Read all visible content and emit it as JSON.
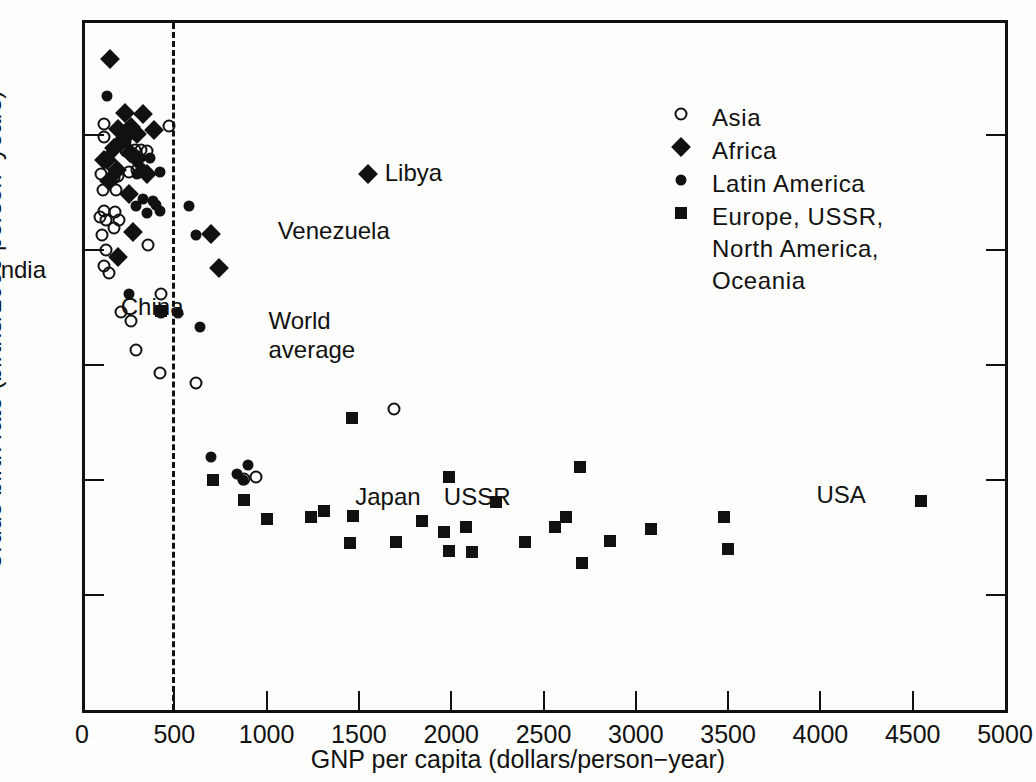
{
  "chart_data": {
    "type": "scatter",
    "title": "",
    "xlabel": "GNP per capita (dollars/person−year)",
    "ylabel": "Crude birth rate (births/1000 person−years)",
    "xlim": [
      0,
      5000
    ],
    "ylim": [
      0,
      60
    ],
    "xticks": [
      0,
      500,
      1000,
      1500,
      2000,
      2500,
      3000,
      3500,
      4000,
      4500,
      5000
    ],
    "yticks": [
      0,
      10,
      20,
      30,
      40,
      50,
      60
    ],
    "grid": false,
    "legend_position": "upper-right-inside",
    "reference_line": {
      "type": "vertical-dashed",
      "x": 490
    },
    "series": [
      {
        "name": "Asia",
        "marker": "open-circle",
        "points": [
          [
            120,
            51.0
          ],
          [
            120,
            49.8
          ],
          [
            105,
            46.6
          ],
          [
            112,
            45.2
          ],
          [
            118,
            43.4
          ],
          [
            100,
            42.9
          ],
          [
            128,
            42.6
          ],
          [
            108,
            41.3
          ],
          [
            132,
            40.0
          ],
          [
            118,
            38.6
          ],
          [
            145,
            38.0
          ],
          [
            160,
            47.4
          ],
          [
            172,
            46.3
          ],
          [
            196,
            46.4
          ],
          [
            186,
            45.2
          ],
          [
            180,
            43.3
          ],
          [
            200,
            42.6
          ],
          [
            176,
            41.9
          ],
          [
            240,
            48.6
          ],
          [
            262,
            48.5
          ],
          [
            252,
            46.8
          ],
          [
            288,
            48.7
          ],
          [
            300,
            47.0
          ],
          [
            320,
            48.7
          ],
          [
            352,
            48.6
          ],
          [
            360,
            40.4
          ],
          [
            470,
            50.8
          ],
          [
            430,
            36.2
          ],
          [
            210,
            34.6
          ],
          [
            268,
            33.8
          ],
          [
            292,
            31.3
          ],
          [
            420,
            29.3
          ],
          [
            620,
            28.4
          ],
          [
            880,
            20.1
          ],
          [
            940,
            20.3
          ],
          [
            1690,
            26.2
          ]
        ]
      },
      {
        "name": "Africa",
        "marker": "filled-diamond",
        "points": [
          [
            150,
            56.6
          ],
          [
            232,
            51.9
          ],
          [
            330,
            51.8
          ],
          [
            196,
            50.5
          ],
          [
            266,
            50.7
          ],
          [
            252,
            50.2
          ],
          [
            300,
            50.1
          ],
          [
            392,
            50.4
          ],
          [
            120,
            47.8
          ],
          [
            138,
            47.8
          ],
          [
            176,
            48.9
          ],
          [
            212,
            49.4
          ],
          [
            188,
            47.0
          ],
          [
            258,
            48.4
          ],
          [
            300,
            47.9
          ],
          [
            148,
            46.0
          ],
          [
            256,
            44.9
          ],
          [
            352,
            46.6
          ],
          [
            276,
            41.6
          ],
          [
            196,
            39.4
          ],
          [
            700,
            41.4
          ],
          [
            740,
            38.4
          ],
          [
            1550,
            46.6
          ]
        ]
      },
      {
        "name": "Latin America",
        "marker": "filled-circle",
        "points": [
          [
            136,
            53.4
          ],
          [
            240,
            49.4
          ],
          [
            270,
            48.2
          ],
          [
            320,
            47.1
          ],
          [
            370,
            48.0
          ],
          [
            300,
            46.6
          ],
          [
            420,
            46.8
          ],
          [
            330,
            44.4
          ],
          [
            386,
            44.3
          ],
          [
            292,
            43.8
          ],
          [
            352,
            43.2
          ],
          [
            422,
            43.4
          ],
          [
            402,
            43.9
          ],
          [
            256,
            36.2
          ],
          [
            430,
            34.5
          ],
          [
            520,
            34.5
          ],
          [
            578,
            43.8
          ],
          [
            620,
            41.3
          ],
          [
            640,
            33.3
          ],
          [
            700,
            22.0
          ],
          [
            900,
            21.3
          ],
          [
            870,
            20.0
          ],
          [
            840,
            20.5
          ]
        ]
      },
      {
        "name": "Europe, USSR, North America, Oceania",
        "marker": "filled-square",
        "points": [
          [
            430,
            34.7
          ],
          [
            710,
            20.0
          ],
          [
            880,
            18.3
          ],
          [
            1000,
            16.6
          ],
          [
            1240,
            16.8
          ],
          [
            1310,
            17.3
          ],
          [
            1470,
            16.9
          ],
          [
            1450,
            14.5
          ],
          [
            1460,
            25.4
          ],
          [
            1700,
            14.6
          ],
          [
            1840,
            16.4
          ],
          [
            1960,
            15.5
          ],
          [
            1990,
            20.3
          ],
          [
            1990,
            13.8
          ],
          [
            2080,
            15.9
          ],
          [
            2110,
            13.7
          ],
          [
            2240,
            18.1
          ],
          [
            2400,
            14.6
          ],
          [
            2560,
            15.9
          ],
          [
            2620,
            16.8
          ],
          [
            2700,
            21.1
          ],
          [
            2710,
            12.8
          ],
          [
            2860,
            14.7
          ],
          [
            3080,
            15.7
          ],
          [
            3480,
            16.8
          ],
          [
            3500,
            14.0
          ],
          [
            4545,
            18.2
          ]
        ]
      }
    ],
    "annotations": [
      {
        "label": "India",
        "x": 0,
        "y": 38.2,
        "align": "left-of-axis"
      },
      {
        "label": "China",
        "x": 210,
        "y": 35.0,
        "align": "label-only"
      },
      {
        "label": "Libya",
        "x": 1640,
        "y": 46.6,
        "align": "right-of-marker"
      },
      {
        "label": "Venezuela",
        "x": 1060,
        "y": 41.6,
        "align": "right-of-marker"
      },
      {
        "label": "World\naverage",
        "x": 1010,
        "y": 33.7,
        "align": "right-of-marker"
      },
      {
        "label": "Japan",
        "x": 1480,
        "y": 18.4,
        "align": "label-only"
      },
      {
        "label": "USSR",
        "x": 1960,
        "y": 18.4,
        "align": "label-only"
      },
      {
        "label": "USA",
        "x": 4300,
        "y": 18.6,
        "align": "left-of-marker"
      }
    ]
  },
  "legend": {
    "items": [
      {
        "symbol": "open-circle",
        "label": "Asia"
      },
      {
        "symbol": "filled-diamond",
        "label": "Africa"
      },
      {
        "symbol": "filled-circle",
        "label": "Latin  America"
      },
      {
        "symbol": "filled-square",
        "label": "Europe, USSR,\nNorth America,\nOceania"
      }
    ]
  },
  "axes": {
    "x_title": "GNP per capita (dollars/person−year)",
    "y_title": "Crude birth rate (births/1000 person−years)",
    "x_tick_labels": [
      "0",
      "500",
      "1000",
      "1500",
      "2000",
      "2500",
      "3000",
      "3500",
      "4000",
      "4500",
      "5000"
    ],
    "y_tick_labels": [
      "0",
      "10",
      "20",
      "30",
      "40",
      "50",
      "60"
    ]
  },
  "inline_annotations": {
    "india": "India",
    "china": "China",
    "libya": "Libya",
    "venezuela": "Venezuela",
    "world_average": "World\naverage",
    "japan": "Japan",
    "ussr": "USSR",
    "usa": "USA"
  },
  "colors": {
    "ink": "#111111",
    "background": "#fdfdfb"
  }
}
